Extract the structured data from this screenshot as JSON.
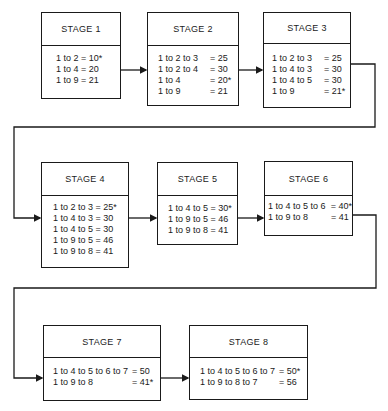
{
  "stages": [
    {
      "title": "STAGE 1",
      "rows": [
        {
          "path": "1 to 2",
          "value": "= 10*"
        },
        {
          "path": "1 to 4",
          "value": "= 20"
        },
        {
          "path": "1 to 9",
          "value": "= 21"
        }
      ]
    },
    {
      "title": "STAGE 2",
      "rows": [
        {
          "path": "1 to 2 to 3",
          "value": "= 25"
        },
        {
          "path": "1 to 2 to 4",
          "value": "= 30"
        },
        {
          "path": "1 to 4",
          "value": "= 20*"
        },
        {
          "path": "1 to 9",
          "value": "= 21"
        }
      ]
    },
    {
      "title": "STAGE 3",
      "rows": [
        {
          "path": "1 to 2 to 3",
          "value": "= 25"
        },
        {
          "path": "1 to 4 to 3",
          "value": "= 30"
        },
        {
          "path": "1 to 4 to 5",
          "value": "= 30"
        },
        {
          "path": "1 to 9",
          "value": "= 21*"
        }
      ]
    },
    {
      "title": "STAGE 4",
      "rows": [
        {
          "path": "1 to 2 to 3",
          "value": "= 25*"
        },
        {
          "path": "1 to 4 to 3",
          "value": "= 30"
        },
        {
          "path": "1 to 4 to 5",
          "value": "= 30"
        },
        {
          "path": "1 to 9 to 5",
          "value": "= 46"
        },
        {
          "path": "1 to 9 to 8",
          "value": "= 41"
        }
      ]
    },
    {
      "title": "STAGE 5",
      "rows": [
        {
          "path": "1 to 4 to 5",
          "value": "= 30*"
        },
        {
          "path": "1 to 9 to 5",
          "value": "= 46"
        },
        {
          "path": "1 to 9 to 8",
          "value": "= 41"
        }
      ]
    },
    {
      "title": "STAGE 6",
      "rows": [
        {
          "path": "1 to 4 to 5 to 6",
          "value": "= 40*"
        },
        {
          "path": "1 to 9 to 8",
          "value": "= 41"
        }
      ]
    },
    {
      "title": "STAGE 7",
      "rows": [
        {
          "path": "1 to 4 to 5 to 6 to 7",
          "value": "= 50"
        },
        {
          "path": "1 to 9 to 8",
          "value": "= 41*"
        }
      ]
    },
    {
      "title": "STAGE 8",
      "rows": [
        {
          "path": "1 to 4 to 5 to 6 to 7",
          "value": "= 50*"
        },
        {
          "path": "1 to 9 to 8 to 7",
          "value": "= 56"
        }
      ]
    }
  ]
}
